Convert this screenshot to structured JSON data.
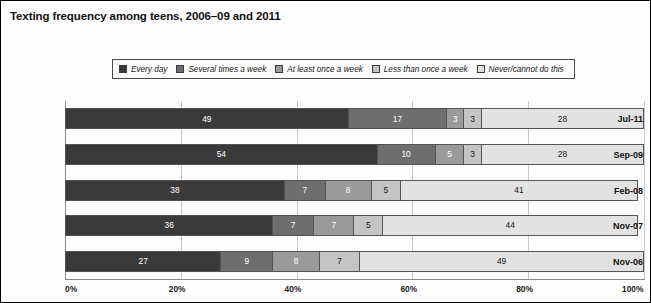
{
  "chart_title": "Texting frequency among teens, 2006–09 and 2011",
  "legend": {
    "entries": [
      {
        "label": "Every day",
        "color": "#3a3a3a"
      },
      {
        "label": "Several times a week",
        "color": "#6e6e6e"
      },
      {
        "label": "At least once a week",
        "color": "#9a9a9a"
      },
      {
        "label": "Less than once a week",
        "color": "#c4c4c4"
      },
      {
        "label": "Never/cannot do this",
        "color": "#e2e2e2"
      }
    ]
  },
  "chart_data": {
    "type": "bar",
    "orientation": "horizontal",
    "stacked": true,
    "normalized_percent": true,
    "title": "Texting frequency among teens, 2006–09 and 2011",
    "xlabel": "",
    "ylabel": "",
    "xlim": [
      0,
      100
    ],
    "xticks": [
      0,
      20,
      40,
      60,
      80,
      100
    ],
    "xtick_labels": [
      "0%",
      "20%",
      "40%",
      "60%",
      "80%",
      "100%"
    ],
    "grid": "vertical",
    "legend_position": "top-center",
    "categories": [
      "Jul-11",
      "Sep-09",
      "Feb-08",
      "Nov-07",
      "Nov-06"
    ],
    "series": [
      {
        "name": "Every day",
        "color": "#3a3a3a",
        "values": [
          49,
          54,
          38,
          36,
          27
        ]
      },
      {
        "name": "Several times a week",
        "color": "#6e6e6e",
        "values": [
          17,
          10,
          7,
          7,
          9
        ]
      },
      {
        "name": "At least once a week",
        "color": "#9a9a9a",
        "values": [
          3,
          5,
          8,
          7,
          8
        ]
      },
      {
        "name": "Less than once a week",
        "color": "#c4c4c4",
        "values": [
          3,
          3,
          5,
          5,
          7
        ]
      },
      {
        "name": "Never/cannot do this",
        "color": "#e2e2e2",
        "values": [
          28,
          28,
          41,
          44,
          49
        ]
      }
    ]
  }
}
